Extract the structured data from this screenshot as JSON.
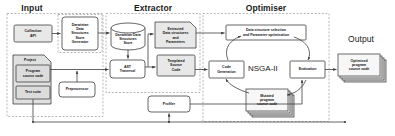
{
  "diagram": {
    "sections": [
      {
        "key": "input",
        "label": "Input"
      },
      {
        "key": "extractor",
        "label": "Extractor"
      },
      {
        "key": "optimiser",
        "label": "Optimiser"
      },
      {
        "key": "output",
        "label": "Output"
      }
    ],
    "nodes": {
      "collection_api": "Collection\nAPI",
      "dds_generator": "Darwinian\nData\nStructures\nStore\nGenerator",
      "dds_store": "Darwinian Data\nStructures\nStore",
      "extracted_ds": "Extracted\nData structures\nand\nParameters",
      "project": "Project",
      "program_source": "Program\nsource code",
      "test_suite": "Test suite",
      "preprocessor": "Preprocessor",
      "ast_traversal": "AST\nTraversal",
      "templated_source": "Templated\nSource\nCode",
      "profiler": "Profiler",
      "param_opt": "Data structure selection\nand Parameter optimisation",
      "code_generation": "Code\nGeneration",
      "evaluation": "Evaluation",
      "mutated_source": "Mutated\nprogram\nsource code",
      "nsga": "NSGA-II",
      "optimised_source": "Optimised\nprogram\nsource code"
    },
    "colors": {
      "stroke": "#3f3f3f",
      "fill_plain": "#ffffff",
      "fill_shaded": "#e8e8e8",
      "fill_stack": "#f2f2f2",
      "dashed_border": "#9a9a9a",
      "text": "#111111",
      "background": "#ffffff"
    }
  }
}
